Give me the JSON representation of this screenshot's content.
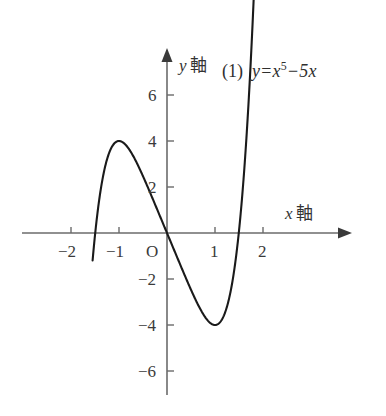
{
  "figure": {
    "background_color": "#ffffff",
    "curve_color": "#1a1a1a",
    "axis_color": "#6b6b6b",
    "text_color": "#333333"
  },
  "annotation": {
    "index": "(1)",
    "equation_y": "y",
    "equation_eq": "=",
    "equation_base": "x",
    "equation_exponent": "5",
    "equation_minus": "−",
    "equation_tail": "5x",
    "equation_plain": "y=x⁵−5x"
  },
  "axes": {
    "x_axis_name_var": "x",
    "x_axis_name_word": "軸",
    "y_axis_name_var": "y",
    "y_axis_name_word": "軸",
    "origin_label": "O"
  },
  "xticks": [
    {
      "label": "−2",
      "value": -2
    },
    {
      "label": "−1",
      "value": -1
    },
    {
      "label": "1",
      "value": 1
    },
    {
      "label": "2",
      "value": 2
    }
  ],
  "yticks": [
    {
      "label": "6",
      "value": 6
    },
    {
      "label": "4",
      "value": 4
    },
    {
      "label": "2",
      "value": 2
    },
    {
      "label": "−2",
      "value": -2
    },
    {
      "label": "−4",
      "value": -4
    },
    {
      "label": "−6",
      "value": -6
    }
  ],
  "chart_data": {
    "type": "line",
    "title": "",
    "subtitle": "",
    "xlabel": "x 軸",
    "ylabel": "y 軸",
    "grid": false,
    "legend": "none",
    "annotations": [
      "(1)",
      "y=x⁵−5x"
    ],
    "xlim": [
      -2.6,
      2.75
    ],
    "ylim": [
      -7.2,
      7.4
    ],
    "xticks": [
      -2,
      -1,
      1,
      2
    ],
    "yticks": [
      6,
      4,
      2,
      -2,
      -4,
      -6
    ],
    "origin_label": "O",
    "series": [
      {
        "name": "y=x^5-5x",
        "formula": "y = x^5 - 5x",
        "domain": [
          -1.55,
          1.85
        ],
        "x": [
          -1.55,
          -1.45,
          -1.35,
          -1.25,
          -1.15,
          -1.05,
          -1.0,
          -0.95,
          -0.85,
          -0.75,
          -0.65,
          -0.55,
          -0.45,
          -0.35,
          -0.25,
          -0.15,
          -0.05,
          0.0,
          0.05,
          0.15,
          0.25,
          0.35,
          0.45,
          0.55,
          0.65,
          0.75,
          0.85,
          0.95,
          1.0,
          1.05,
          1.15,
          1.25,
          1.35,
          1.45,
          1.55,
          1.65,
          1.75,
          1.85
        ],
        "y": [
          -1.21,
          1.84,
          2.27,
          3.2,
          3.74,
          3.97,
          4.0,
          3.97,
          3.81,
          3.51,
          3.13,
          2.7,
          2.23,
          1.74,
          1.25,
          0.75,
          0.25,
          0.0,
          -0.25,
          -0.75,
          -1.25,
          -1.74,
          -2.23,
          -2.7,
          -3.13,
          -3.51,
          -3.81,
          -3.97,
          -4.0,
          -3.97,
          -3.74,
          -3.2,
          -2.27,
          -1.84,
          1.21,
          3.03,
          7.64,
          12.43
        ],
        "key_points": [
          {
            "label": "local maximum",
            "x": -1,
            "y": 4
          },
          {
            "label": "origin crossing",
            "x": 0,
            "y": 0
          },
          {
            "label": "local minimum",
            "x": 1,
            "y": -4
          }
        ]
      }
    ]
  }
}
